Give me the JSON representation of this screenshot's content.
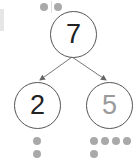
{
  "diagram": {
    "type": "number-bond",
    "whole": {
      "value": "7",
      "color": "#222222",
      "dots_above": 2
    },
    "parts": [
      {
        "value": "2",
        "color": "#222222",
        "dots": 2
      },
      {
        "value": "5",
        "color": "#9a9a9a",
        "dots": 5
      }
    ],
    "colors": {
      "stroke": "#555555",
      "dot": "#a9a9a9",
      "arrow": "#777777"
    }
  }
}
